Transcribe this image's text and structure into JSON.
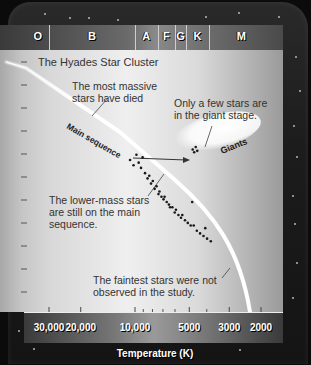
{
  "chart_data": {
    "type": "scatter",
    "title": "The Hyades Star Cluster",
    "xlabel": "Temperature (K)",
    "ylabel": "",
    "x_scale": "log-reversed",
    "xlim": [
      40000,
      1700
    ],
    "x_ticks": [
      {
        "value": 30000,
        "label": "30,000"
      },
      {
        "value": 20000,
        "label": "20,000"
      },
      {
        "value": 10000,
        "label": "10,000"
      },
      {
        "value": 5000,
        "label": "5000"
      },
      {
        "value": 3000,
        "label": "3000"
      },
      {
        "value": 2000,
        "label": "2000"
      }
    ],
    "x_minor_ticks": [
      9000,
      8000,
      7000,
      6000,
      4000
    ],
    "y_tick_count": 11,
    "spectral_classes": [
      {
        "label": "O",
        "from": 40000,
        "to": 30000
      },
      {
        "label": "B",
        "from": 30000,
        "to": 10000
      },
      {
        "label": "A",
        "from": 10000,
        "to": 7500
      },
      {
        "label": "F",
        "from": 7500,
        "to": 6000
      },
      {
        "label": "G",
        "from": 6000,
        "to": 5200
      },
      {
        "label": "K",
        "from": 5200,
        "to": 3900
      },
      {
        "label": "M",
        "from": 3900,
        "to": 1700
      }
    ],
    "main_sequence_label": "Main sequence",
    "giants_label": "Giants",
    "series": [
      {
        "name": "Main sequence stars",
        "points": [
          [
            11500,
            0.42
          ],
          [
            11000,
            0.44
          ],
          [
            10600,
            0.4
          ],
          [
            10300,
            0.43
          ],
          [
            10000,
            0.45
          ],
          [
            9800,
            0.41
          ],
          [
            9500,
            0.47
          ],
          [
            9200,
            0.49
          ],
          [
            9000,
            0.48
          ],
          [
            8800,
            0.51
          ],
          [
            8600,
            0.5
          ],
          [
            8400,
            0.53
          ],
          [
            8200,
            0.52
          ],
          [
            8000,
            0.55
          ],
          [
            7900,
            0.54
          ],
          [
            7700,
            0.56
          ],
          [
            7500,
            0.57
          ],
          [
            7400,
            0.56
          ],
          [
            7200,
            0.58
          ],
          [
            7000,
            0.59
          ],
          [
            6900,
            0.6
          ],
          [
            6700,
            0.6
          ],
          [
            6500,
            0.62
          ],
          [
            6400,
            0.61
          ],
          [
            6200,
            0.63
          ],
          [
            6000,
            0.64
          ],
          [
            5900,
            0.63
          ],
          [
            5700,
            0.65
          ],
          [
            5500,
            0.66
          ],
          [
            5300,
            0.67
          ],
          [
            5100,
            0.67
          ],
          [
            4900,
            0.69
          ],
          [
            4700,
            0.7
          ],
          [
            4500,
            0.71
          ],
          [
            4300,
            0.72
          ],
          [
            4100,
            0.73
          ],
          [
            5200,
            0.58
          ],
          [
            4400,
            0.68
          ]
        ]
      },
      {
        "name": "Giants",
        "points": [
          [
            5300,
            0.38
          ],
          [
            5100,
            0.37
          ],
          [
            5200,
            0.39
          ],
          [
            5000,
            0.385
          ]
        ]
      }
    ],
    "annotations": [
      {
        "text": "The most massive stars have died"
      },
      {
        "text": "Only a few stars are in the giant stage."
      },
      {
        "text": "The lower-mass stars are still on the main sequence."
      },
      {
        "text": "The faintest stars were not observed in the study."
      }
    ]
  },
  "annotations": {
    "massive": [
      "The most massive",
      "stars have died"
    ],
    "giants": [
      "Only a few stars are",
      "in the giant stage."
    ],
    "lower": [
      "The lower-mass stars",
      "are still on the main",
      "sequence."
    ],
    "faint": [
      "The faintest stars were not",
      "observed in the study."
    ]
  }
}
